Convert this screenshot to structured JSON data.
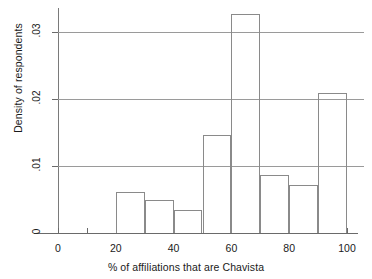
{
  "chart_data": {
    "type": "bar",
    "title": "",
    "subtitle": "",
    "xlabel": "% of affiliations that are Chavista",
    "ylabel": "Density of respondents",
    "xlim": [
      0,
      100
    ],
    "ylim": [
      0,
      0.0335
    ],
    "grid": true,
    "legend": null,
    "bin_width": 10,
    "x_major_ticks": [
      0,
      20,
      40,
      60,
      80,
      100
    ],
    "x_minor_ticks": [
      10,
      30,
      50,
      70,
      90
    ],
    "x_tick_labels": [
      "0",
      "20",
      "40",
      "60",
      "80",
      "100"
    ],
    "y_ticks": [
      0,
      0.01,
      0.02,
      0.03
    ],
    "y_tick_labels": [
      "0",
      ".01",
      ".02",
      ".03"
    ],
    "gridline_values": [
      0.01,
      0.02,
      0.03
    ],
    "bins": [
      {
        "label": "0–10",
        "x0": 0,
        "x1": 10,
        "value": 0
      },
      {
        "label": "10–20",
        "x0": 10,
        "x1": 20,
        "value": 0
      },
      {
        "label": "20–30",
        "x0": 20,
        "x1": 30,
        "value": 0.0061
      },
      {
        "label": "30–40",
        "x0": 30,
        "x1": 40,
        "value": 0.0049
      },
      {
        "label": "40–50",
        "x0": 40,
        "x1": 50,
        "value": 0.0034
      },
      {
        "label": "50–60",
        "x0": 50,
        "x1": 60,
        "value": 0.0146
      },
      {
        "label": "60–70",
        "x0": 60,
        "x1": 70,
        "value": 0.0327
      },
      {
        "label": "70–80",
        "x0": 70,
        "x1": 80,
        "value": 0.0087
      },
      {
        "label": "80–90",
        "x0": 80,
        "x1": 90,
        "value": 0.0072
      },
      {
        "label": "90–100",
        "x0": 90,
        "x1": 100,
        "value": 0.0209
      }
    ],
    "colors": {
      "bar_stroke": "#8a8a8a",
      "bar_fill": "transparent",
      "gridline": "#9a9a9a",
      "axis": "#6a6a6a",
      "text": "#1a1a1a",
      "background": "#ffffff"
    }
  }
}
